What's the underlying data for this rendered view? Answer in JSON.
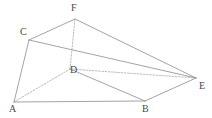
{
  "figure": {
    "name": "triangular-prism-solid",
    "canvas": {
      "width": 212,
      "height": 118,
      "background": "#ffffff"
    },
    "style": {
      "solid_edge_color": "#8c8c8c",
      "hidden_edge_color": "#9e9e9e",
      "label_color": "#4a4a4a",
      "solid_edge_width": 0.8,
      "hidden_edge_width": 0.7,
      "hidden_dash_pattern": "1.6 1.6"
    },
    "vertices": [
      {
        "id": "A",
        "label": "A",
        "x": 14,
        "y": 102,
        "label_x": 9,
        "label_y": 104,
        "hidden": false
      },
      {
        "id": "B",
        "label": "B",
        "x": 145,
        "y": 101,
        "label_x": 142,
        "label_y": 104,
        "hidden": false
      },
      {
        "id": "C",
        "label": "C",
        "x": 29,
        "y": 40,
        "label_x": 20,
        "label_y": 27,
        "hidden": false
      },
      {
        "id": "D",
        "label": "D",
        "x": 70,
        "y": 69,
        "label_x": 70,
        "label_y": 65,
        "hidden": true
      },
      {
        "id": "E",
        "label": "E",
        "x": 196,
        "y": 78,
        "label_x": 199,
        "label_y": 81,
        "hidden": false
      },
      {
        "id": "F",
        "label": "F",
        "x": 75,
        "y": 19,
        "label_x": 71,
        "label_y": 3,
        "hidden": false
      }
    ],
    "edges": [
      {
        "id": "AB",
        "from": "A",
        "to": "B",
        "style": "solid"
      },
      {
        "id": "AC",
        "from": "A",
        "to": "C",
        "style": "solid"
      },
      {
        "id": "CF",
        "from": "C",
        "to": "F",
        "style": "solid"
      },
      {
        "id": "FE",
        "from": "F",
        "to": "E",
        "style": "solid"
      },
      {
        "id": "BE",
        "from": "B",
        "to": "E",
        "style": "solid"
      },
      {
        "id": "CE",
        "from": "C",
        "to": "E",
        "style": "solid"
      },
      {
        "id": "DB",
        "from": "D",
        "to": "B",
        "style": "solid"
      },
      {
        "id": "AD",
        "from": "A",
        "to": "D",
        "style": "dashed"
      },
      {
        "id": "DE",
        "from": "D",
        "to": "E",
        "style": "dashed"
      },
      {
        "id": "DF",
        "from": "D",
        "to": "F",
        "style": "dashed"
      }
    ]
  }
}
